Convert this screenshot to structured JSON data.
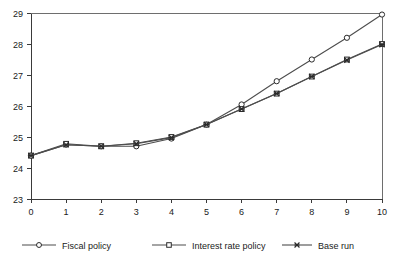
{
  "chart_data": {
    "type": "line",
    "title": "",
    "subtitle": "",
    "xlabel": "",
    "ylabel": "",
    "x": [
      0,
      1,
      2,
      3,
      4,
      5,
      6,
      7,
      8,
      9,
      10
    ],
    "categories": [
      "0",
      "1",
      "2",
      "3",
      "4",
      "5",
      "6",
      "7",
      "8",
      "9",
      "10"
    ],
    "xlim": [
      0,
      10
    ],
    "ylim": [
      23,
      29
    ],
    "xticks": [
      "0",
      "1",
      "2",
      "3",
      "4",
      "5",
      "6",
      "7",
      "8",
      "9",
      "10"
    ],
    "yticks": [
      "23",
      "24",
      "25",
      "26",
      "27",
      "28",
      "29"
    ],
    "grid": false,
    "legend_position": "bottom",
    "series": [
      {
        "name": "Fiscal policy",
        "marker": "circle",
        "color": "#4d4d4d",
        "values": [
          24.4,
          24.75,
          24.7,
          24.7,
          24.95,
          25.4,
          26.05,
          26.8,
          27.5,
          28.2,
          28.95
        ]
      },
      {
        "name": "Interest rate policy",
        "marker": "square",
        "color": "#4d4d4d",
        "values": [
          24.4,
          24.78,
          24.7,
          24.8,
          25.0,
          25.4,
          25.9,
          26.4,
          26.95,
          27.5,
          28.0
        ]
      },
      {
        "name": "Base run",
        "marker": "star",
        "color": "#4d4d4d",
        "values": [
          24.4,
          24.75,
          24.7,
          24.78,
          24.98,
          25.4,
          25.9,
          26.4,
          26.95,
          27.48,
          27.98
        ]
      }
    ]
  },
  "legend": {
    "items": [
      {
        "label": "Fiscal policy",
        "marker": "circle"
      },
      {
        "label": "Interest rate policy",
        "marker": "square"
      },
      {
        "label": "Base run",
        "marker": "star"
      }
    ]
  },
  "axes": {
    "y_ticks": [
      "29",
      "28",
      "27",
      "26",
      "25",
      "24",
      "23"
    ],
    "x_ticks": [
      "0",
      "1",
      "2",
      "3",
      "4",
      "5",
      "6",
      "7",
      "8",
      "9",
      "10"
    ]
  },
  "colors": {
    "line": "#4d4d4d",
    "axis": "#3a3a3a",
    "frame": "#6e6e6e",
    "text": "#1a1a1a",
    "background": "#ffffff"
  }
}
